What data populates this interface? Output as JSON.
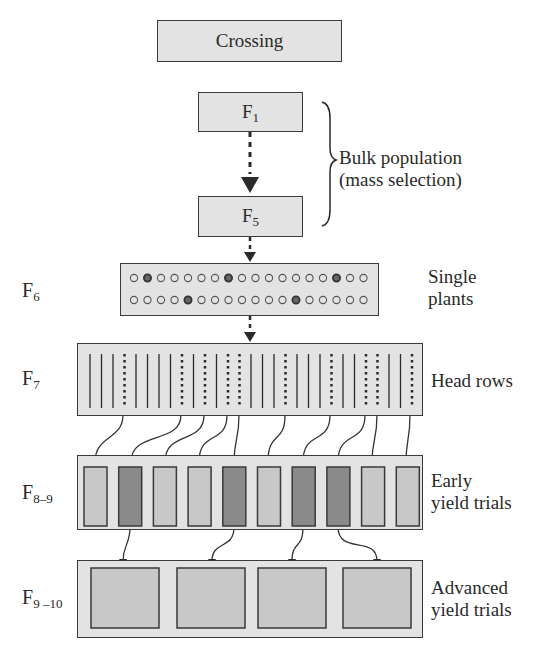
{
  "diagram": {
    "nodes": {
      "crossing": {
        "label": "Crossing"
      },
      "f1": {
        "label": "F",
        "sub": "1"
      },
      "f5": {
        "label": "F",
        "sub": "5"
      }
    },
    "side_labels": {
      "bulk": [
        "Bulk population",
        "(mass selection)"
      ],
      "single_plants": [
        "Single",
        "plants"
      ],
      "head_rows": [
        "Head rows"
      ],
      "early": [
        "Early",
        "yield trials"
      ],
      "advanced": [
        "Advanced",
        "yield trials"
      ]
    },
    "generation_labels": {
      "f6": {
        "label": "F",
        "sub": "6"
      },
      "f7": {
        "label": "F",
        "sub": "7"
      },
      "f8_9": {
        "label": "F",
        "sub": "8–9"
      },
      "f9_10": {
        "label": "F",
        "sub": "9 –10"
      }
    },
    "single_plants": {
      "rows": 2,
      "per_row": 18,
      "selected_top": [
        1,
        7,
        15
      ],
      "selected_bottom": [
        4,
        12
      ]
    },
    "head_rows": {
      "count": 29,
      "selected": [
        3,
        8,
        10,
        12,
        13,
        17,
        21,
        24,
        25,
        28
      ]
    },
    "early_yield_trials": {
      "count": 10,
      "selected": [
        1,
        4,
        6,
        7
      ]
    },
    "advanced_yield_trials": {
      "count": 4
    },
    "colors": {
      "box_fill": "#e3e3e3",
      "plot_fill": "#c8c8c8",
      "selected_fill": "#8a8a8a",
      "stroke": "#3a3a3a"
    }
  }
}
